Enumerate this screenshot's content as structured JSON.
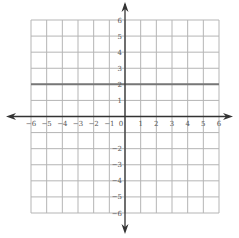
{
  "chart_data": {
    "type": "line",
    "title": "",
    "xlabel": "",
    "ylabel": "",
    "xlim": [
      -6,
      6
    ],
    "ylim": [
      -6,
      6
    ],
    "grid": true,
    "x_ticks": [
      "-6",
      "-5",
      "-4",
      "-3",
      "-2",
      "-1",
      "0",
      "1",
      "2",
      "3",
      "4",
      "5",
      "6"
    ],
    "y_ticks": [
      "6",
      "5",
      "4",
      "3",
      "2",
      "1",
      "-2",
      "-3",
      "-4",
      "-5",
      "-6"
    ],
    "series": [
      {
        "name": "y = 2",
        "equation": "y = 2",
        "x": [
          -6,
          6
        ],
        "y": [
          2,
          2
        ]
      }
    ],
    "colors": {
      "grid": "#b5b5b5",
      "axis": "#333333",
      "line": "#777777"
    }
  }
}
